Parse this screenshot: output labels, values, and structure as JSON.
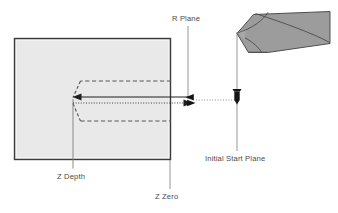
{
  "diagram": {
    "type": "cnc-drill-cycle-cross-section",
    "labels": {
      "r_plane": "R Plane",
      "z_depth": "Z Depth",
      "z_zero": "Z Zero",
      "initial_start_plane": "Initial Start Plane"
    },
    "colors": {
      "workpiece_fill": "#e9e9e9",
      "workpiece_stroke": "#3b3b3b",
      "tool_fill": "#9a9a9a",
      "tool_stroke": "#4a4a4a",
      "line": "#6e6e6e",
      "motion_line": "#2b2b2b",
      "text": "#4a4a4a",
      "background": "#ffffff"
    },
    "icons": {
      "tool_body": "drill-tool-3d-icon",
      "tool_marker": "drill-bit-marker-icon",
      "feed_arrow": "feed-arrow-icon",
      "retract_arrow": "retract-arrow-icon",
      "hole_outline": "hole-outline-icon"
    },
    "geometry": {
      "workpiece": {
        "x": 14,
        "y": 38,
        "width": 157,
        "height": 122
      },
      "hole": {
        "tip_x": 73,
        "top_y": 81,
        "bottom_y": 121,
        "right_x": 171
      },
      "r_plane_x": 188,
      "z_zero_x": 170,
      "initial_start_plane_x": 237,
      "feed_line_y": 97,
      "retract_line_y": 103,
      "z_depth_leader_x": 73
    }
  }
}
